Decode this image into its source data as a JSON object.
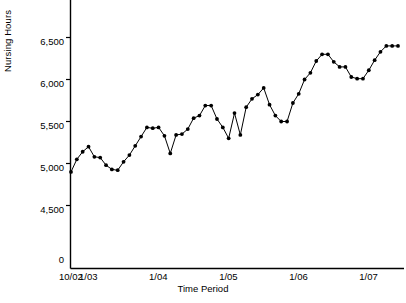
{
  "chart_data": {
    "type": "line",
    "title": "",
    "xlabel": "Time Period",
    "ylabel": "Nursing Hours",
    "ylim": [
      4350,
      6650
    ],
    "y_axis_break": true,
    "y_zero_label": "0",
    "yticks": [
      4500,
      5000,
      5500,
      6000,
      6500
    ],
    "ytick_labels": [
      "4,500",
      "5,000",
      "5,500",
      "6,000",
      "6,500"
    ],
    "xtick_labels": [
      "10/02",
      "1/03",
      "1/04",
      "1/05",
      "1/06",
      "1/07"
    ],
    "xtick_index": [
      0,
      3,
      15,
      27,
      39,
      51
    ],
    "grid": false,
    "legend": null,
    "marker": "filled-circle",
    "series_name": "Nursing Hours",
    "n_points": 57,
    "values": [
      4900,
      5050,
      5140,
      5200,
      5080,
      5070,
      4980,
      4930,
      4920,
      5020,
      5100,
      5210,
      5320,
      5430,
      5420,
      5430,
      5330,
      5120,
      5340,
      5350,
      5410,
      5540,
      5570,
      5690,
      5690,
      5530,
      5430,
      5300,
      5600,
      5340,
      5670,
      5770,
      5820,
      5900,
      5700,
      5570,
      5500,
      5500,
      5720,
      5830,
      6000,
      6080,
      6220,
      6300,
      6300,
      6210,
      6150,
      6150,
      6030,
      6010,
      6010,
      6110,
      6230,
      6330,
      6400,
      6400,
      6400
    ]
  },
  "axis": {
    "ylabel_text": "Nursing Hours",
    "xlabel_text": "Time Period"
  }
}
